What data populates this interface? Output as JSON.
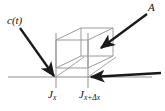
{
  "figure": {
    "kind": "flux-control-volume-diagram",
    "width": 165,
    "height": 111,
    "background_color": "#ffffff"
  },
  "labels": {
    "concentration": "c(t)",
    "area": "A",
    "flux_left_base": "J",
    "flux_left_sub": "x",
    "flux_right_base": "J",
    "flux_right_sub": "x+Δx"
  },
  "colors": {
    "box_stroke": "#9a9a9a",
    "baseline_stroke": "#8f8f8f",
    "vertical_stroke": "#9a9a9a",
    "arrow_fill": "#1a1a1a",
    "text": "#111111"
  },
  "geometry": {
    "baseline_y": 77,
    "left_plane_x": 56,
    "right_plane_x": 88,
    "box_front_left": 56,
    "box_front_right": 88,
    "box_front_top": 40,
    "box_front_bottom": 68,
    "box_depth_dx": 25,
    "box_depth_dy": -12
  },
  "arrows": [
    {
      "name": "concentration-arrow",
      "from_x": 20,
      "from_y": 28,
      "to_x": 55,
      "to_y": 77,
      "points_to": "left face / J_x plane"
    },
    {
      "name": "area-arrow",
      "from_x": 147,
      "from_y": 14,
      "to_x": 100,
      "to_y": 49,
      "points_to": "box face A"
    },
    {
      "name": "flux-out-arrow",
      "from_x": 160,
      "from_y": 73,
      "to_x": 89,
      "to_y": 77,
      "points_to": "right plane J_{x+dx}"
    }
  ]
}
